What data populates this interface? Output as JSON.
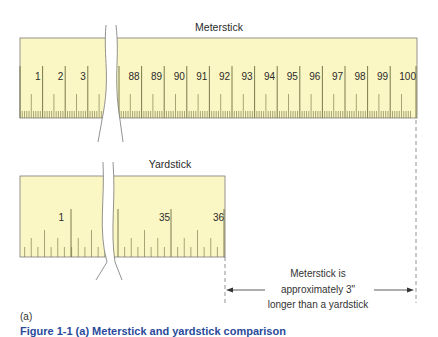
{
  "meterstick": {
    "title": "Meterstick",
    "left_labels": [
      "1",
      "2",
      "3"
    ],
    "right_labels": [
      "88",
      "89",
      "90",
      "91",
      "92",
      "93",
      "94",
      "95",
      "96",
      "97",
      "98",
      "99",
      "100"
    ]
  },
  "yardstick": {
    "title": "Yardstick",
    "left_labels": [
      "1"
    ],
    "right_labels": [
      "35",
      "36"
    ]
  },
  "annotation": {
    "line1": "Meterstick is",
    "line2": "approximately 3\"",
    "line3": "longer than a yardstick"
  },
  "panel_label": "(a)",
  "caption": "Figure 1-1  (a) Meterstick and yardstick comparison",
  "colors": {
    "ruler_fill": "#fbf7c4",
    "ruler_border": "#6e6e6e",
    "tick": "#6b6b3e",
    "caption_blue": "#2a4a9a"
  }
}
